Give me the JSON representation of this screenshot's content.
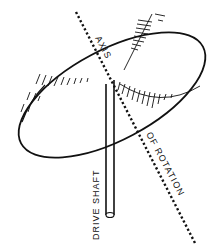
{
  "diagram": {
    "labels": {
      "axis": "AXIS",
      "of_rotation": "OF ROTATION",
      "drive_shaft": "DRIVE SHAFT"
    },
    "colors": {
      "line": "#111111",
      "background": "#ffffff"
    }
  }
}
